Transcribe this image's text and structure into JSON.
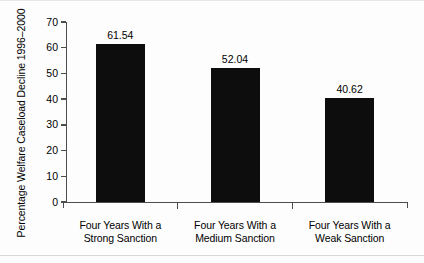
{
  "chart_data": {
    "type": "bar",
    "title": "",
    "subtitle": "",
    "xlabel": "",
    "ylabel": "Percentage Welfare Caseload Decline 1996–2000",
    "categories": [
      "Four Years With a Strong Sanction",
      "Four Years With a Medium Sanction",
      "Four Years With a Weak Sanction"
    ],
    "category_lines": [
      [
        "Four Years With a",
        "Strong Sanction"
      ],
      [
        "Four Years With a",
        "Medium Sanction"
      ],
      [
        "Four Years With a",
        "Weak Sanction"
      ]
    ],
    "values": [
      61.54,
      52.04,
      40.62
    ],
    "value_labels": [
      "61.54",
      "52.04",
      "40.62"
    ],
    "ylim": [
      0,
      70
    ],
    "ytick_values": [
      70,
      60,
      50,
      40,
      30,
      20,
      10,
      0
    ],
    "ytick_labels": [
      "70",
      "60",
      "50",
      "40",
      "30",
      "20",
      "10",
      "0"
    ],
    "grid": false,
    "legend": false,
    "legend_position": "none",
    "bar_color": "#0d0d0d",
    "axis_color": "#4d4d4d",
    "background_color": "#fdfdfd"
  }
}
